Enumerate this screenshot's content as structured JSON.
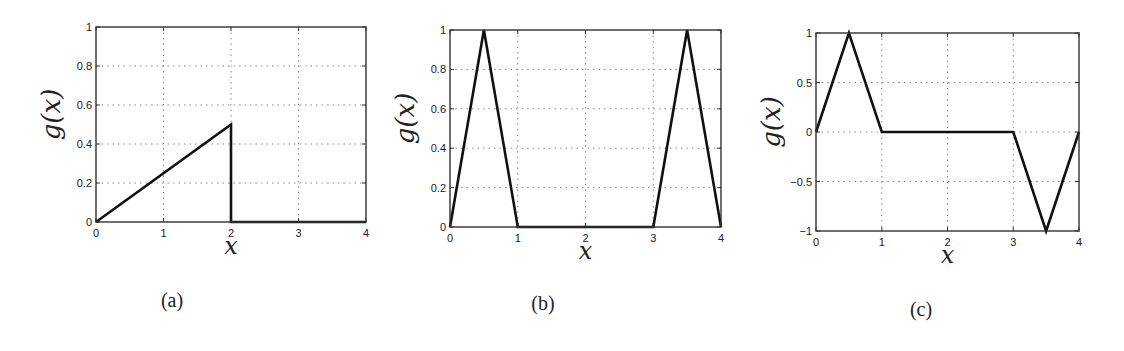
{
  "chart_data": [
    {
      "type": "line",
      "panel": "a",
      "caption": "(a)",
      "title": "",
      "xlabel": "x",
      "ylabel": "g(x)",
      "xlim": [
        0,
        4
      ],
      "ylim": [
        0,
        1
      ],
      "xticks": [
        0,
        1,
        2,
        3,
        4
      ],
      "yticks": [
        0,
        0.2,
        0.4,
        0.6,
        0.8,
        1
      ],
      "ytick_labels": [
        "0",
        "0.2",
        "0.4",
        "0.6",
        "0.8",
        "1"
      ],
      "grid": true,
      "series": [
        {
          "name": "g(x)",
          "x": [
            0,
            2,
            2,
            4
          ],
          "y": [
            0,
            0.5,
            0,
            0
          ]
        }
      ],
      "box": {
        "left": 96,
        "top": 27,
        "right": 366,
        "bottom": 222
      }
    },
    {
      "type": "line",
      "panel": "b",
      "caption": "(b)",
      "title": "",
      "xlabel": "x",
      "ylabel": "g(x)",
      "xlim": [
        0,
        4
      ],
      "ylim": [
        0,
        1
      ],
      "xticks": [
        0,
        1,
        2,
        3,
        4
      ],
      "yticks": [
        0,
        0.2,
        0.4,
        0.6,
        0.8,
        1
      ],
      "ytick_labels": [
        "0",
        "0.2",
        "0.4",
        "0.6",
        "0.8",
        "1"
      ],
      "grid": true,
      "series": [
        {
          "name": "g(x)",
          "x": [
            0,
            0.5,
            1,
            3,
            3.5,
            4
          ],
          "y": [
            0,
            1,
            0,
            0,
            1,
            0
          ]
        }
      ],
      "box": {
        "left": 450,
        "top": 30,
        "right": 721,
        "bottom": 227
      }
    },
    {
      "type": "line",
      "panel": "c",
      "caption": "(c)",
      "title": "",
      "xlabel": "x",
      "ylabel": "g(x)",
      "xlim": [
        0,
        4
      ],
      "ylim": [
        -1,
        1
      ],
      "xticks": [
        0,
        1,
        2,
        3,
        4
      ],
      "yticks": [
        -1,
        -0.5,
        0,
        0.5,
        1
      ],
      "ytick_labels": [
        "−1",
        "−0.5",
        "0",
        "0.5",
        "1"
      ],
      "grid": true,
      "series": [
        {
          "name": "g(x)",
          "x": [
            0,
            0.5,
            1,
            3,
            3.5,
            4
          ],
          "y": [
            0,
            1,
            0,
            0,
            -1,
            0
          ]
        }
      ],
      "box": {
        "left": 816,
        "top": 33,
        "right": 1079,
        "bottom": 231
      }
    }
  ],
  "captions": [
    "(a)",
    "(b)",
    "(c)"
  ],
  "caption_positions": [
    {
      "x": 172,
      "y": 307
    },
    {
      "x": 543,
      "y": 310
    },
    {
      "x": 921,
      "y": 316
    }
  ]
}
